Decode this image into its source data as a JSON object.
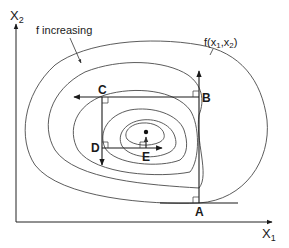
{
  "diagram": {
    "axes": {
      "x_label": "X",
      "x_sub": "1",
      "y_label": "X",
      "y_sub": "2"
    },
    "annotations": {
      "increasing": "f increasing",
      "function_prefix": "f(x",
      "function_sub1": "1",
      "function_mid": ",x",
      "function_sub2": "2",
      "function_suffix": ")"
    },
    "points": [
      {
        "id": "A",
        "label": "A"
      },
      {
        "id": "B",
        "label": "B"
      },
      {
        "id": "C",
        "label": "C"
      },
      {
        "id": "D",
        "label": "D"
      },
      {
        "id": "E",
        "label": "E"
      }
    ],
    "search_path": [
      "A",
      "B",
      "C",
      "D",
      "E",
      "optimum"
    ],
    "contour_count": 6,
    "colors": {
      "line": "#1a1a1a",
      "contour": "#4a4a4a",
      "background": "#ffffff"
    }
  }
}
